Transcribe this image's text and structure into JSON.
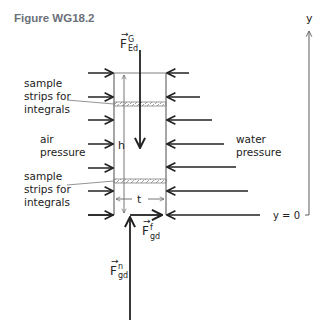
{
  "figure": {
    "title": "Figure WG18.2",
    "labels": {
      "sample_strips_top": [
        "sample",
        "strips for",
        "integrals"
      ],
      "sample_strips_bottom": [
        "sample",
        "strips for",
        "integrals"
      ],
      "air_pressure": [
        "air",
        "pressure"
      ],
      "water_pressure": [
        "water",
        "pressure"
      ],
      "height": "h",
      "thickness": "t",
      "y_axis": "y",
      "y_zero": "y = 0"
    },
    "forces": {
      "gravity": {
        "symbol": "F",
        "sup": "G",
        "sub": "Ed"
      },
      "friction": {
        "symbol": "F",
        "sup": "f",
        "sub": "gd"
      },
      "normal": {
        "symbol": "F",
        "sup": "n",
        "sub": "gd"
      }
    },
    "colors": {
      "line": "#222222",
      "gate": "#808080",
      "axis": "#777777",
      "title": "#6b7079"
    }
  }
}
